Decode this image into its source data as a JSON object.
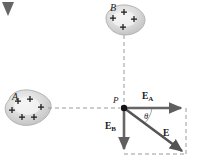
{
  "figure": {
    "type": "physics-vector-diagram",
    "background_color": "#ffffff",
    "width": 199,
    "height": 165,
    "corner_mark": "page-corner-triangle"
  },
  "charged_bodies": [
    {
      "id": "A",
      "label": "A",
      "label_x": 12,
      "label_y": 92,
      "center_x": 29,
      "center_y": 108,
      "radius_x": 23,
      "radius_y": 16,
      "charge_sign": "+",
      "charge_count": 6,
      "fill_color": "#d8d8d8",
      "charge_marks": [
        {
          "x": 18,
          "y": 101
        },
        {
          "x": 30,
          "y": 99
        },
        {
          "x": 12,
          "y": 110
        },
        {
          "x": 41,
          "y": 107
        },
        {
          "x": 22,
          "y": 117
        },
        {
          "x": 34,
          "y": 117
        }
      ]
    },
    {
      "id": "B",
      "label": "B",
      "label_x": 110,
      "label_y": 3,
      "center_x": 124,
      "center_y": 20,
      "radius_x": 21,
      "radius_y": 15,
      "charge_sign": "+",
      "charge_count": 4,
      "fill_color": "#d8d8d8",
      "charge_marks": [
        {
          "x": 124,
          "y": 12
        },
        {
          "x": 113,
          "y": 18
        },
        {
          "x": 134,
          "y": 19
        },
        {
          "x": 123,
          "y": 27
        }
      ]
    }
  ],
  "field_point": {
    "label": "P",
    "label_x": 113,
    "label_y": 96,
    "x": 124,
    "y": 108,
    "dot_radius": 3,
    "color": "#1a1a1a"
  },
  "vectors": [
    {
      "name": "E_A",
      "label": "E",
      "subscript": "A",
      "label_x": 142,
      "label_y": 92,
      "from_x": 124,
      "from_y": 108,
      "to_x": 186,
      "to_y": 108,
      "direction": "right",
      "color": "#666666",
      "description": "field at P due to body A"
    },
    {
      "name": "E_B",
      "label": "E",
      "subscript": "B",
      "label_x": 105,
      "label_y": 122,
      "from_x": 124,
      "from_y": 108,
      "to_x": 124,
      "to_y": 154,
      "direction": "down",
      "color": "#666666",
      "description": "field at P due to body B"
    },
    {
      "name": "E_resultant",
      "label": "E",
      "subscript": "",
      "label_x": 163,
      "label_y": 129,
      "from_x": 124,
      "from_y": 108,
      "to_x": 186,
      "to_y": 154,
      "direction": "down-right",
      "color": "#5a5a5a",
      "description": "resultant electric field at P"
    }
  ],
  "angle": {
    "symbol": "θ",
    "label_x": 144,
    "label_y": 112,
    "vertex_x": 124,
    "vertex_y": 108,
    "between": [
      "E_A",
      "E_resultant"
    ],
    "arc_radius": 26,
    "color": "#8a8a8a"
  },
  "construction_lines": [
    {
      "name": "A-to-P-axis",
      "x1": 48,
      "y1": 108,
      "x2": 120,
      "y2": 108,
      "style": "dashed",
      "color": "#9a9a9a"
    },
    {
      "name": "B-to-P-axis",
      "x1": 124,
      "y1": 35,
      "x2": 124,
      "y2": 104,
      "style": "dashed",
      "color": "#9a9a9a"
    },
    {
      "name": "parallelogram-right-side",
      "x1": 186,
      "y1": 108,
      "x2": 186,
      "y2": 154,
      "style": "dashed",
      "color": "#9a9a9a"
    },
    {
      "name": "parallelogram-bottom-side",
      "x1": 124,
      "y1": 154,
      "x2": 186,
      "y2": 154,
      "style": "dashed",
      "color": "#9a9a9a"
    }
  ]
}
